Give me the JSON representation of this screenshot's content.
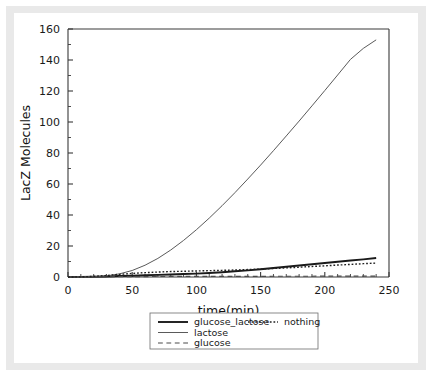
{
  "figure": {
    "background_color": "#ffffff",
    "frame_color": "#e9e9e9"
  },
  "chart_data": {
    "type": "line",
    "title": "",
    "xlabel": "time(min)",
    "ylabel": "LacZ Molecules",
    "xlim": [
      0,
      250
    ],
    "ylim": [
      0,
      160
    ],
    "xticks": [
      0,
      50,
      100,
      150,
      200,
      250
    ],
    "yticks": [
      0,
      20,
      40,
      60,
      80,
      100,
      120,
      140,
      160
    ],
    "xtick_labels": [
      "0",
      "50",
      "100",
      "150",
      "200",
      "250"
    ],
    "ytick_labels": [
      "0",
      "20",
      "40",
      "60",
      "80",
      "100",
      "120",
      "140",
      "160"
    ],
    "x_minor_step": 10,
    "y_minor_step": 10,
    "grid": false,
    "legend_position": "below-axes",
    "x": [
      0,
      10,
      20,
      30,
      40,
      50,
      60,
      70,
      80,
      90,
      100,
      110,
      120,
      130,
      140,
      150,
      160,
      170,
      180,
      190,
      200,
      210,
      220,
      230,
      240
    ],
    "series": [
      {
        "name": "glucose_lactose",
        "style": "solid",
        "width": 1.9,
        "color": "#1a1a1a",
        "values": [
          0,
          0.05,
          0.15,
          0.35,
          0.6,
          0.85,
          1.1,
          1.35,
          1.6,
          1.9,
          2.2,
          2.6,
          3.1,
          3.7,
          4.3,
          5.0,
          5.8,
          6.6,
          7.4,
          8.2,
          9.0,
          9.8,
          10.6,
          11.4,
          12.3
        ]
      },
      {
        "name": "lactose",
        "style": "solid",
        "width": 1.0,
        "color": "#5a5a5a",
        "values": [
          0,
          0.05,
          0.2,
          0.7,
          2.0,
          4.2,
          7.6,
          12.0,
          17.4,
          23.6,
          30.5,
          38.0,
          46.0,
          54.4,
          63.2,
          72.2,
          81.5,
          91.0,
          100.6,
          110.4,
          120.3,
          130.3,
          140.4,
          147.5,
          153.0
        ]
      },
      {
        "name": "glucose",
        "style": "dashed",
        "width": 1.2,
        "color": "#4a4a4a",
        "values": [
          0,
          0.05,
          0.1,
          0.15,
          0.2,
          0.25,
          0.3,
          0.32,
          0.35,
          0.37,
          0.4,
          0.4,
          0.42,
          0.43,
          0.45,
          0.45,
          0.47,
          0.48,
          0.5,
          0.5,
          0.52,
          0.53,
          0.55,
          0.55,
          0.57
        ]
      },
      {
        "name": "nothing",
        "style": "dotted",
        "width": 1.4,
        "color": "#1f1f1f",
        "values": [
          0,
          0.1,
          0.4,
          1.0,
          1.7,
          2.3,
          2.8,
          3.2,
          3.5,
          3.7,
          3.9,
          4.1,
          4.3,
          4.5,
          4.8,
          5.1,
          5.5,
          5.9,
          6.3,
          6.8,
          7.2,
          7.7,
          8.1,
          8.6,
          9.0
        ]
      }
    ],
    "legend_entries": [
      {
        "label": "glucose_lactose",
        "style": "solid",
        "width": 1.9,
        "color": "#1a1a1a"
      },
      {
        "label": "nothing",
        "style": "dotted",
        "width": 1.4,
        "color": "#1f1f1f"
      },
      {
        "label": "lactose",
        "style": "solid",
        "width": 1.0,
        "color": "#5a5a5a"
      },
      {
        "label": "glucose",
        "style": "dashed",
        "width": 1.2,
        "color": "#4a4a4a"
      }
    ]
  }
}
